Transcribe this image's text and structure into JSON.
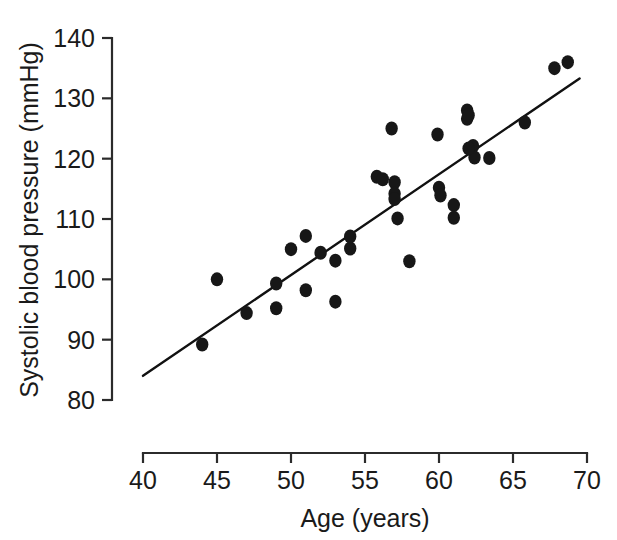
{
  "chart_data": {
    "type": "scatter",
    "title": "",
    "xlabel": "Age (years)",
    "ylabel": "Systolic blood pressure (mmHg)",
    "xlim": [
      40,
      70
    ],
    "ylim": [
      80,
      140
    ],
    "xticks": [
      40,
      45,
      50,
      55,
      60,
      65,
      70
    ],
    "yticks": [
      80,
      90,
      100,
      110,
      120,
      130,
      140
    ],
    "xtick_labels": [
      "40",
      "45",
      "50",
      "55",
      "60",
      "65",
      "70"
    ],
    "ytick_labels": [
      "80",
      "90",
      "100",
      "110",
      "120",
      "130",
      "140"
    ],
    "grid": false,
    "legend": null,
    "marker": "filled-circle",
    "marker_color": "#171717",
    "point_count": 36,
    "points": [
      {
        "x": 44.0,
        "y": 89.2
      },
      {
        "x": 45.0,
        "y": 100.0
      },
      {
        "x": 47.0,
        "y": 94.4
      },
      {
        "x": 49.0,
        "y": 99.3
      },
      {
        "x": 49.0,
        "y": 95.2
      },
      {
        "x": 50.0,
        "y": 105.0
      },
      {
        "x": 51.0,
        "y": 107.2
      },
      {
        "x": 51.0,
        "y": 98.2
      },
      {
        "x": 52.0,
        "y": 104.4
      },
      {
        "x": 53.0,
        "y": 103.1
      },
      {
        "x": 53.0,
        "y": 96.3
      },
      {
        "x": 54.0,
        "y": 105.1
      },
      {
        "x": 54.0,
        "y": 107.1
      },
      {
        "x": 55.8,
        "y": 117.0
      },
      {
        "x": 56.2,
        "y": 116.6
      },
      {
        "x": 56.8,
        "y": 125.0
      },
      {
        "x": 57.0,
        "y": 116.1
      },
      {
        "x": 57.0,
        "y": 114.2
      },
      {
        "x": 57.0,
        "y": 113.3
      },
      {
        "x": 57.2,
        "y": 110.1
      },
      {
        "x": 58.0,
        "y": 103.0
      },
      {
        "x": 59.9,
        "y": 124.0
      },
      {
        "x": 60.0,
        "y": 115.2
      },
      {
        "x": 61.0,
        "y": 112.3
      },
      {
        "x": 61.0,
        "y": 110.2
      },
      {
        "x": 61.9,
        "y": 128.0
      },
      {
        "x": 61.9,
        "y": 126.6
      },
      {
        "x": 62.0,
        "y": 127.2
      },
      {
        "x": 62.3,
        "y": 122.1
      },
      {
        "x": 62.4,
        "y": 120.2
      },
      {
        "x": 63.4,
        "y": 120.1
      },
      {
        "x": 65.8,
        "y": 126.0
      },
      {
        "x": 67.8,
        "y": 135.0
      },
      {
        "x": 68.7,
        "y": 136.0
      },
      {
        "x": 60.1,
        "y": 113.9
      },
      {
        "x": 62.0,
        "y": 121.7
      }
    ],
    "fit_line": {
      "kind": "linear-regression",
      "x_start": 40.0,
      "y_start": 84.0,
      "x_end": 69.5,
      "y_end": 133.3,
      "slope": 1.67,
      "intercept": 17.2,
      "color": "#111111"
    }
  }
}
